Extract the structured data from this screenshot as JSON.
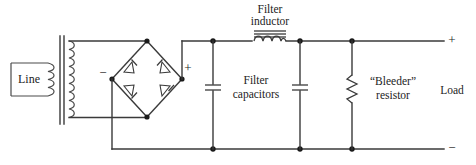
{
  "diagram": {
    "type": "electronic-schematic",
    "canvas": {
      "width": 476,
      "height": 165
    },
    "colors": {
      "wire": "#3a3a3a",
      "node": "#1a1a1a",
      "text": "#1c1c1c",
      "background": "#ffffff"
    }
  },
  "labels": {
    "line_source": "Line",
    "filter_inductor_l1": "Filter",
    "filter_inductor_l2": "inductor",
    "filter_capacitors_l1": "Filter",
    "filter_capacitors_l2": "capacitors",
    "bleeder_resistor_l1": "“Bleeder”",
    "bleeder_resistor_l2": "resistor",
    "load": "Load"
  },
  "polarity": {
    "bridge_negative": "−",
    "bridge_positive": "+",
    "output_positive": "+",
    "output_negative": "−"
  },
  "components": [
    {
      "name": "ac-line-source",
      "label": "Line",
      "kind": "source"
    },
    {
      "name": "transformer",
      "label": "",
      "kind": "iron-core-transformer"
    },
    {
      "name": "diode-bridge",
      "label": "",
      "kind": "full-wave-bridge",
      "diode_count": 4
    },
    {
      "name": "filter-inductor",
      "label": "Filter inductor",
      "kind": "iron-core-inductor"
    },
    {
      "name": "filter-capacitor-1",
      "label": "Filter capacitors",
      "kind": "capacitor"
    },
    {
      "name": "filter-capacitor-2",
      "label": "Filter capacitors",
      "kind": "capacitor"
    },
    {
      "name": "bleeder-resistor",
      "label": "“Bleeder” resistor",
      "kind": "resistor"
    },
    {
      "name": "load-terminals",
      "label": "Load",
      "kind": "terminal-pair"
    }
  ]
}
